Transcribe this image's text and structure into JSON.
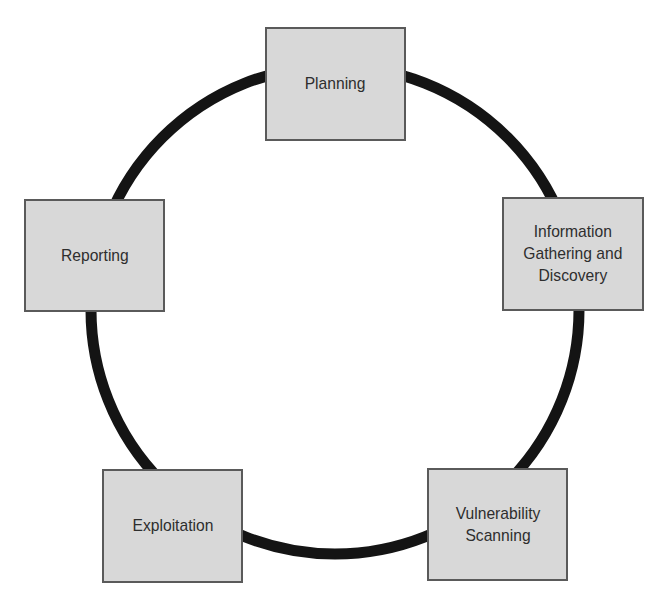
{
  "diagram": {
    "type": "cycle",
    "colors": {
      "ring": "#141414",
      "node_fill": "#d8d8d8",
      "node_border": "#5a5a5a",
      "text": "#2e2e2e"
    },
    "ring": {
      "cx": 335,
      "cy": 310,
      "r": 244,
      "stroke_width": 11
    },
    "nodes": [
      {
        "id": "planning",
        "label": "Planning",
        "x": 265,
        "y": 27,
        "w": 141,
        "h": 114
      },
      {
        "id": "information-gathering",
        "label": "Information\nGathering and\nDiscovery",
        "x": 502,
        "y": 197,
        "w": 142,
        "h": 114
      },
      {
        "id": "vulnerability-scanning",
        "label": "Vulnerability\nScanning",
        "x": 427,
        "y": 468,
        "w": 141,
        "h": 113
      },
      {
        "id": "exploitation",
        "label": "Exploitation",
        "x": 102,
        "y": 469,
        "w": 141,
        "h": 114
      },
      {
        "id": "reporting",
        "label": "Reporting",
        "x": 24,
        "y": 199,
        "w": 141,
        "h": 113
      }
    ]
  }
}
